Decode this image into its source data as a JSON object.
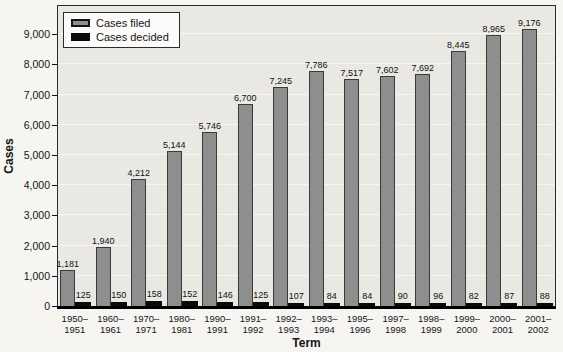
{
  "colors": {
    "plot_background": "#e9e8e3",
    "gridline": "#f7f6f1",
    "cases_filed_bar": "#8e8e8e",
    "cases_decided_bar": "#0a0a0a",
    "axis": "#000000",
    "page_background": "#f6f5f2"
  },
  "chart_data": {
    "type": "bar",
    "title": "",
    "xlabel": "Term",
    "ylabel": "Cases",
    "ylim": [
      0,
      9000
    ],
    "ytick_interval": 1000,
    "yticks": [
      {
        "value": 0,
        "label": "0"
      },
      {
        "value": 1000,
        "label": "1,000"
      },
      {
        "value": 2000,
        "label": "2,000"
      },
      {
        "value": 3000,
        "label": "3,000"
      },
      {
        "value": 4000,
        "label": "4,000"
      },
      {
        "value": 5000,
        "label": "5,000"
      },
      {
        "value": 6000,
        "label": "6,000"
      },
      {
        "value": 7000,
        "label": "7,000"
      },
      {
        "value": 8000,
        "label": "8,000"
      },
      {
        "value": 9000,
        "label": "9,000"
      }
    ],
    "grid": "subtle horizontal lines at each 1,000",
    "legend_position": "top-left inside plot",
    "categories": [
      "1950–1951",
      "1960–1961",
      "1970–1971",
      "1980–1981",
      "1990–1991",
      "1991–1992",
      "1992–1993",
      "1993–1994",
      "1995–1996",
      "1997–1998",
      "1998–1999",
      "1999–2000",
      "2000–2001",
      "2001–2002"
    ],
    "series": [
      {
        "name": "Cases filed",
        "color": "#8e8e8e",
        "values": [
          1181,
          1940,
          4212,
          5144,
          5746,
          6700,
          7245,
          7786,
          7517,
          7602,
          7692,
          8445,
          8965,
          9176
        ],
        "labels": [
          "1,181",
          "1,940",
          "4,212",
          "5,144",
          "5,746",
          "6,700",
          "7,245",
          "7,786",
          "7,517",
          "7,602",
          "7,692",
          "8,445",
          "8,965",
          "9,176"
        ]
      },
      {
        "name": "Cases decided",
        "color": "#0a0a0a",
        "values": [
          125,
          150,
          158,
          152,
          146,
          125,
          107,
          84,
          84,
          90,
          96,
          82,
          87,
          88
        ],
        "labels": [
          "125",
          "150",
          "158",
          "152",
          "146",
          "125",
          "107",
          "84",
          "84",
          "90",
          "96",
          "82",
          "87",
          "88"
        ]
      }
    ]
  }
}
